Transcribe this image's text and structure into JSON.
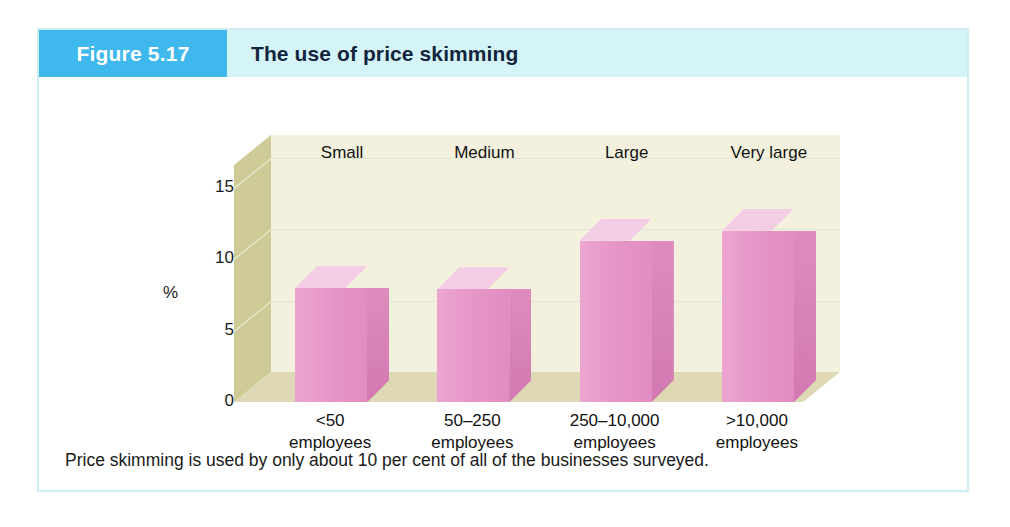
{
  "figure": {
    "badge_label": "Figure 5.17",
    "title": "The use of price skimming",
    "caption": "Price skimming is used by only about 10 per cent of all of the businesses surveyed.",
    "badge_color": "#3fb8ee",
    "header_band_color": "#d4f4f7",
    "border_color": "#cdeef5"
  },
  "chart_data": {
    "type": "bar",
    "title": "The use of price skimming",
    "xlabel": "",
    "ylabel": "%",
    "ylim": [
      0,
      15
    ],
    "yticks": [
      "0",
      "5",
      "10",
      "15"
    ],
    "grid": true,
    "legend": "none",
    "style": "3d-column",
    "categories": [
      "<50\nemployees",
      "50–250\nemployees",
      "250–10,000\nemployees",
      ">10,000\nemployees"
    ],
    "category_headings": [
      "Small",
      "Medium",
      "Large",
      "Very large"
    ],
    "category_lines": [
      {
        "line1": "<50",
        "line2": "employees"
      },
      {
        "line1": "50–250",
        "line2": "employees"
      },
      {
        "line1": "250–10,000",
        "line2": "employees"
      },
      {
        "line1": ">10,000",
        "line2": "employees"
      }
    ],
    "values": [
      8.0,
      7.9,
      11.3,
      12.0
    ],
    "colors": {
      "bar_front": "#e697c8",
      "bar_top": "#f2cde3",
      "bar_side": "#d87fb5",
      "plot_back_wall": "#f3f1dd",
      "plot_left_wall": "#cfcb96",
      "plot_floor": "#ded9b4",
      "gridline": "#e3e5d8"
    }
  }
}
